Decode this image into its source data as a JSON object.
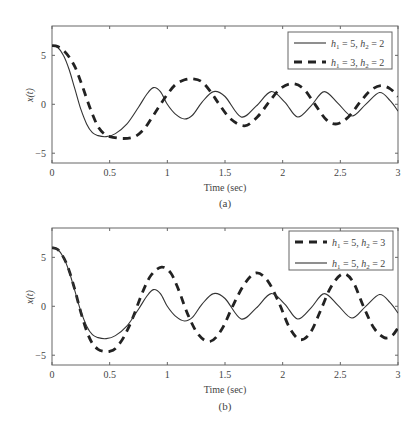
{
  "chart_data": [
    {
      "type": "line",
      "panel": "(a)",
      "caption": "(a)",
      "xlabel": "Time (sec)",
      "ylabel": "x(t)",
      "xlim": [
        0,
        3
      ],
      "ylim": [
        -6,
        8
      ],
      "xticks": [
        0,
        0.5,
        1,
        1.5,
        2,
        2.5,
        3
      ],
      "xtick_labels": [
        "0",
        "0.5",
        "1",
        "1.5",
        "2",
        "2.5",
        "3"
      ],
      "yticks": [
        -5,
        0,
        5
      ],
      "ytick_labels": [
        "−5",
        "0",
        "5"
      ],
      "grid": false,
      "legend_position": "upper right",
      "series": [
        {
          "name": "h1 = 5, h2 = 2",
          "legend": {
            "h1": "5",
            "h2": "2"
          },
          "style": "solid",
          "x": [
            0,
            0.05,
            0.1,
            0.15,
            0.2,
            0.25,
            0.3,
            0.35,
            0.4,
            0.47,
            0.55,
            0.65,
            0.75,
            0.82,
            0.88,
            0.94,
            1.0,
            1.07,
            1.15,
            1.22,
            1.3,
            1.4,
            1.5,
            1.64,
            1.77,
            1.9,
            2.02,
            2.13,
            2.25,
            2.36,
            2.48,
            2.6,
            2.72,
            2.84,
            2.93,
            3.0
          ],
          "y": [
            6.0,
            5.8,
            5.0,
            3.5,
            1.5,
            -0.5,
            -2.0,
            -2.9,
            -3.2,
            -3.3,
            -3.0,
            -2.0,
            -0.3,
            1.0,
            1.7,
            1.3,
            0.0,
            -1.0,
            -1.5,
            -1.1,
            0.2,
            1.3,
            0.8,
            -1.3,
            -0.2,
            1.3,
            0.2,
            -1.3,
            -0.1,
            1.3,
            0.1,
            -1.2,
            0.0,
            1.2,
            0.4,
            -0.7
          ]
        },
        {
          "name": "h1 = 3, h2 = 2",
          "legend": {
            "h1": "3",
            "h2": "2"
          },
          "style": "dashed",
          "x": [
            0,
            0.05,
            0.1,
            0.15,
            0.2,
            0.25,
            0.3,
            0.35,
            0.4,
            0.45,
            0.5,
            0.62,
            0.72,
            0.8,
            0.87,
            0.93,
            1.0,
            1.07,
            1.15,
            1.22,
            1.3,
            1.38,
            1.45,
            1.55,
            1.67,
            1.78,
            1.88,
            1.98,
            2.08,
            2.18,
            2.28,
            2.38,
            2.47,
            2.57,
            2.67,
            2.76,
            2.85,
            2.93,
            3.0
          ],
          "y": [
            6.0,
            5.9,
            5.5,
            4.8,
            3.8,
            2.3,
            0.6,
            -1.0,
            -2.3,
            -3.0,
            -3.3,
            -3.5,
            -3.3,
            -2.5,
            -1.3,
            -0.2,
            1.0,
            2.0,
            2.5,
            2.6,
            2.3,
            1.2,
            0.0,
            -1.5,
            -2.2,
            -1.3,
            0.2,
            1.6,
            2.1,
            1.6,
            0.0,
            -1.6,
            -2.0,
            -1.3,
            0.2,
            1.4,
            1.9,
            1.6,
            0.8
          ]
        }
      ]
    },
    {
      "type": "line",
      "panel": "(b)",
      "caption": "(b)",
      "xlabel": "Time (sec)",
      "ylabel": "x(t)",
      "xlim": [
        0,
        3
      ],
      "ylim": [
        -6,
        8
      ],
      "xticks": [
        0,
        0.5,
        1,
        1.5,
        2,
        2.5,
        3
      ],
      "xtick_labels": [
        "0",
        "0.5",
        "1",
        "1.5",
        "2",
        "2.5",
        "3"
      ],
      "yticks": [
        -5,
        0,
        5
      ],
      "ytick_labels": [
        "−5",
        "0",
        "5"
      ],
      "grid": false,
      "legend_position": "upper right",
      "series": [
        {
          "name": "h1 = 5, h2 = 3",
          "legend": {
            "h1": "5",
            "h2": "3"
          },
          "style": "dashed",
          "x": [
            0,
            0.05,
            0.1,
            0.15,
            0.2,
            0.25,
            0.3,
            0.35,
            0.4,
            0.45,
            0.5,
            0.55,
            0.62,
            0.7,
            0.78,
            0.86,
            0.95,
            1.03,
            1.1,
            1.18,
            1.27,
            1.37,
            1.47,
            1.57,
            1.67,
            1.77,
            1.87,
            1.97,
            2.06,
            2.15,
            2.24,
            2.33,
            2.42,
            2.52,
            2.61,
            2.7,
            2.79,
            2.88,
            2.95,
            3.0
          ],
          "y": [
            6.0,
            5.8,
            5.0,
            3.6,
            1.6,
            -0.6,
            -2.5,
            -3.8,
            -4.4,
            -4.6,
            -4.6,
            -4.3,
            -3.2,
            -1.2,
            1.3,
            3.2,
            4.0,
            3.4,
            1.6,
            -0.9,
            -2.9,
            -3.6,
            -2.4,
            0.1,
            2.3,
            3.4,
            2.6,
            0.3,
            -2.2,
            -3.4,
            -2.7,
            -0.4,
            2.0,
            3.3,
            2.5,
            0.0,
            -2.2,
            -3.2,
            -3.0,
            -2.2
          ]
        },
        {
          "name": "h1 = 5, h2 = 2",
          "legend": {
            "h1": "5",
            "h2": "2"
          },
          "style": "solid",
          "x": [
            0,
            0.05,
            0.1,
            0.15,
            0.2,
            0.25,
            0.3,
            0.35,
            0.4,
            0.47,
            0.55,
            0.65,
            0.75,
            0.82,
            0.88,
            0.94,
            1.0,
            1.07,
            1.15,
            1.22,
            1.3,
            1.4,
            1.5,
            1.64,
            1.77,
            1.9,
            2.02,
            2.13,
            2.25,
            2.36,
            2.48,
            2.6,
            2.72,
            2.84,
            2.93,
            3.0
          ],
          "y": [
            6.0,
            5.8,
            5.0,
            3.5,
            1.5,
            -0.5,
            -2.0,
            -2.9,
            -3.2,
            -3.3,
            -3.0,
            -2.0,
            -0.3,
            1.0,
            1.7,
            1.3,
            0.0,
            -1.0,
            -1.5,
            -1.1,
            0.2,
            1.3,
            0.8,
            -1.3,
            -0.2,
            1.3,
            0.2,
            -1.3,
            -0.1,
            1.3,
            0.1,
            -1.2,
            0.0,
            1.2,
            0.4,
            -0.7
          ]
        }
      ]
    }
  ],
  "panels": [
    {
      "caption": "(a)",
      "xlabel": "Time (sec)",
      "ylabel": "x(t)"
    },
    {
      "caption": "(b)",
      "xlabel": "Time (sec)",
      "ylabel": "x(t)"
    }
  ],
  "colors": {
    "axis": "#666666",
    "line": "#222222",
    "text": "#444444"
  }
}
